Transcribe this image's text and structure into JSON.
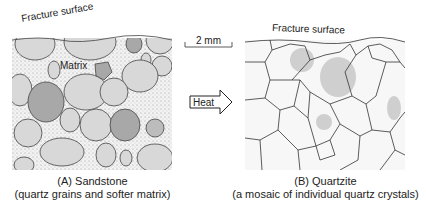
{
  "panel_a": {
    "fracture_label": "Fracture surface",
    "matrix_label": "Matrix",
    "caption_title": "(A) Sandstone",
    "caption_sub": "(quartz grains and softer matrix)"
  },
  "panel_b": {
    "fracture_label": "Fracture surface",
    "caption_title": "(B) Quartzite",
    "caption_sub": "(a mosaic of individual quartz crystals)"
  },
  "scale_bar": {
    "label": "2 mm"
  },
  "arrow": {
    "label": "Heat"
  },
  "colors": {
    "grain_light": "#d8d8d8",
    "grain_dark": "#a8a8a8",
    "matrix": "#f0f0f0",
    "outline": "#333333"
  }
}
